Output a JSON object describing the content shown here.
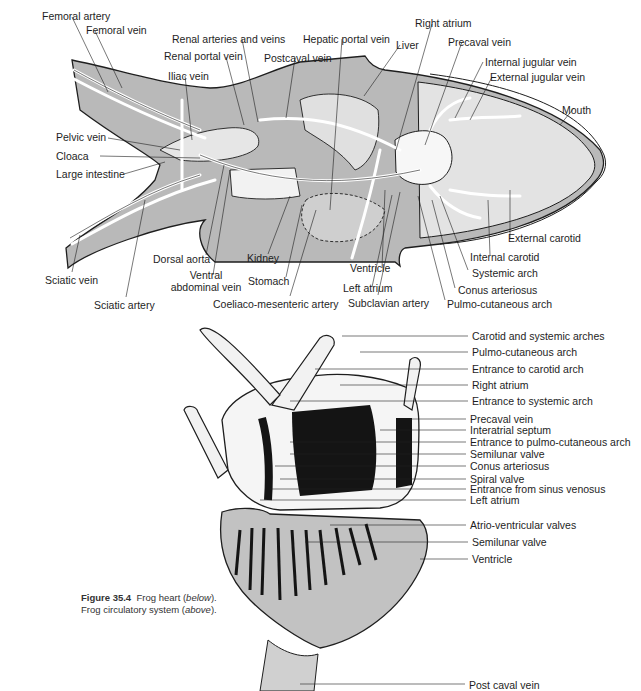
{
  "figure": {
    "number": "Figure 35.4",
    "caption_line1": "Frog heart (",
    "caption_line1_italic": "below",
    "caption_line1_end": ").",
    "caption_line2": "Frog circulatory system (",
    "caption_line2_italic": "above",
    "caption_line2_end": ")."
  },
  "colors": {
    "body_gray": "#b9b9b9",
    "light_gray": "#dcdcdc",
    "pale_fill": "#ebebeb",
    "ventricle_gray": "#c2c2c2",
    "outline": "#1e1e1e",
    "background": "#ffffff"
  },
  "circulatory_system": {
    "title": "Frog circulatory system",
    "labels": [
      {
        "id": "femoral-artery",
        "text": "Femoral artery",
        "x": 42,
        "y": 10
      },
      {
        "id": "femoral-vein",
        "text": "Femoral vein",
        "x": 86,
        "y": 24
      },
      {
        "id": "renal-arteries-and-veins",
        "text": "Renal arteries and veins",
        "x": 172,
        "y": 33
      },
      {
        "id": "renal-portal-vein",
        "text": "Renal portal vein",
        "x": 164,
        "y": 50
      },
      {
        "id": "iliac-vein",
        "text": "Iliac vein",
        "x": 168,
        "y": 70
      },
      {
        "id": "postcaval-vein",
        "text": "Postcaval vein",
        "x": 264,
        "y": 52
      },
      {
        "id": "hepatic-portal-vein",
        "text": "Hepatic portal vein",
        "x": 303,
        "y": 33
      },
      {
        "id": "liver",
        "text": "Liver",
        "x": 396,
        "y": 39
      },
      {
        "id": "right-atrium",
        "text": "Right atrium",
        "x": 415,
        "y": 17
      },
      {
        "id": "precaval-vein",
        "text": "Precaval vein",
        "x": 448,
        "y": 36
      },
      {
        "id": "internal-jugular-vein",
        "text": "Internal jugular vein",
        "x": 485,
        "y": 56
      },
      {
        "id": "external-jugular-vein",
        "text": "External jugular vein",
        "x": 490,
        "y": 71
      },
      {
        "id": "mouth",
        "text": "Mouth",
        "x": 562,
        "y": 104
      },
      {
        "id": "pelvic-vein",
        "text": "Pelvic vein",
        "x": 56,
        "y": 131
      },
      {
        "id": "cloaca",
        "text": "Cloaca",
        "x": 56,
        "y": 150
      },
      {
        "id": "large-intestine",
        "text": "Large intestine",
        "x": 56,
        "y": 168
      },
      {
        "id": "dorsal-aorta",
        "text": "Dorsal aorta",
        "x": 153,
        "y": 253
      },
      {
        "id": "ventral-abdominal-vein",
        "text": "Ventral\nabdominal vein",
        "x": 168,
        "y": 269,
        "multiline": true
      },
      {
        "id": "kidney",
        "text": "Kidney",
        "x": 247,
        "y": 252
      },
      {
        "id": "stomach",
        "text": "Stomach",
        "x": 248,
        "y": 275
      },
      {
        "id": "coeliaco-mesenteric-artery",
        "text": "Coeliaco-mesenteric artery",
        "x": 213,
        "y": 298
      },
      {
        "id": "sciatic-vein",
        "text": "Sciatic vein",
        "x": 45,
        "y": 274
      },
      {
        "id": "sciatic-artery",
        "text": "Sciatic artery",
        "x": 94,
        "y": 299
      },
      {
        "id": "ventricle",
        "text": "Ventricle",
        "x": 350,
        "y": 262
      },
      {
        "id": "left-atrium",
        "text": "Left atrium",
        "x": 343,
        "y": 282
      },
      {
        "id": "subclavian-artery",
        "text": "Subclavian artery",
        "x": 348,
        "y": 297
      },
      {
        "id": "external-carotid",
        "text": "External carotid",
        "x": 508,
        "y": 232
      },
      {
        "id": "internal-carotid",
        "text": "Internal carotid",
        "x": 470,
        "y": 251
      },
      {
        "id": "systemic-arch",
        "text": "Systemic arch",
        "x": 472,
        "y": 267
      },
      {
        "id": "conus-arteriosus",
        "text": "Conus arteriosus",
        "x": 458,
        "y": 284
      },
      {
        "id": "pulmo-cutaneous-arch",
        "text": "Pulmo-cutaneous arch",
        "x": 447,
        "y": 298
      }
    ]
  },
  "heart": {
    "title": "Frog heart",
    "labels": [
      {
        "id": "carotid-and-systemic-arches",
        "text": "Carotid and systemic arches",
        "x": 472,
        "y": 330
      },
      {
        "id": "pulmo-cutaneous-arch",
        "text": "Pulmo-cutaneous arch",
        "x": 472,
        "y": 346
      },
      {
        "id": "entrance-to-carotid-arch",
        "text": "Entrance to carotid arch",
        "x": 472,
        "y": 363
      },
      {
        "id": "right-atrium",
        "text": "Right atrium",
        "x": 472,
        "y": 379
      },
      {
        "id": "entrance-to-systemic-arch",
        "text": "Entrance to systemic arch",
        "x": 472,
        "y": 395
      },
      {
        "id": "precaval-vein",
        "text": "Precaval vein",
        "x": 470,
        "y": 413
      },
      {
        "id": "interatrial-septum",
        "text": "Interatrial septum",
        "x": 470,
        "y": 425
      },
      {
        "id": "entrance-to-pulmo-cutaneous-arch",
        "text": "Entrance to pulmo-cutaneous arch",
        "x": 470,
        "y": 437
      },
      {
        "id": "semilunar-valve-upper",
        "text": "Semilunar valve",
        "x": 470,
        "y": 449
      },
      {
        "id": "conus-arteriosus",
        "text": "Conus arteriosus",
        "x": 470,
        "y": 461
      },
      {
        "id": "spiral-valve",
        "text": "Spiral valve",
        "x": 470,
        "y": 474
      },
      {
        "id": "entrance-from-sinus-venosus",
        "text": "Entrance from sinus venosus",
        "x": 470,
        "y": 484
      },
      {
        "id": "left-atrium",
        "text": "Left atrium",
        "x": 470,
        "y": 495
      },
      {
        "id": "atrio-ventricular-valves",
        "text": "Atrio-ventricular valves",
        "x": 470,
        "y": 519
      },
      {
        "id": "semilunar-valve-lower",
        "text": "Semilunar valve",
        "x": 472,
        "y": 536
      },
      {
        "id": "ventricle",
        "text": "Ventricle",
        "x": 472,
        "y": 553
      },
      {
        "id": "post-caval-vein",
        "text": "Post caval vein",
        "x": 469,
        "y": 679
      }
    ]
  }
}
